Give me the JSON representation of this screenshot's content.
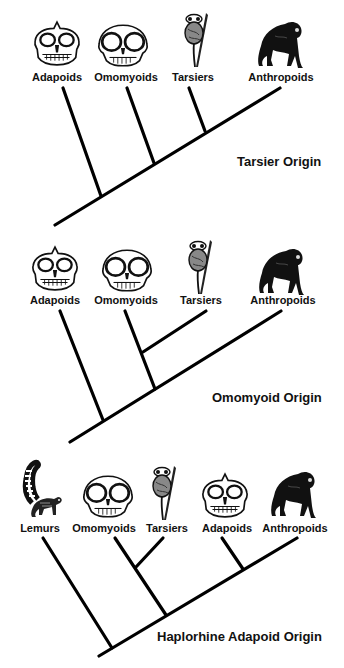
{
  "colors": {
    "line": "#000000",
    "background": "#ffffff",
    "text": "#111111"
  },
  "trees": [
    {
      "title": "Tarsier Origin",
      "taxa": [
        {
          "label": "Adapoids",
          "icon": "adapoid-skull-icon"
        },
        {
          "label": "Omomyoids",
          "icon": "omomyoid-skull-icon"
        },
        {
          "label": "Tarsiers",
          "icon": "tarsier-icon"
        },
        {
          "label": "Anthropoids",
          "icon": "chimpanzee-icon"
        }
      ]
    },
    {
      "title": "Omomyoid Origin",
      "taxa": [
        {
          "label": "Adapoids",
          "icon": "adapoid-skull-icon"
        },
        {
          "label": "Omomyoids",
          "icon": "omomyoid-skull-icon"
        },
        {
          "label": "Tarsiers",
          "icon": "tarsier-icon"
        },
        {
          "label": "Anthropoids",
          "icon": "chimpanzee-icon"
        }
      ]
    },
    {
      "title": "Haplorhine Adapoid Origin",
      "taxa": [
        {
          "label": "Lemurs",
          "icon": "lemur-icon"
        },
        {
          "label": "Omomyoids",
          "icon": "omomyoid-skull-icon"
        },
        {
          "label": "Tarsiers",
          "icon": "tarsier-icon"
        },
        {
          "label": "Adapoids",
          "icon": "adapoid-skull-icon"
        },
        {
          "label": "Anthropoids",
          "icon": "chimpanzee-icon"
        }
      ]
    }
  ]
}
